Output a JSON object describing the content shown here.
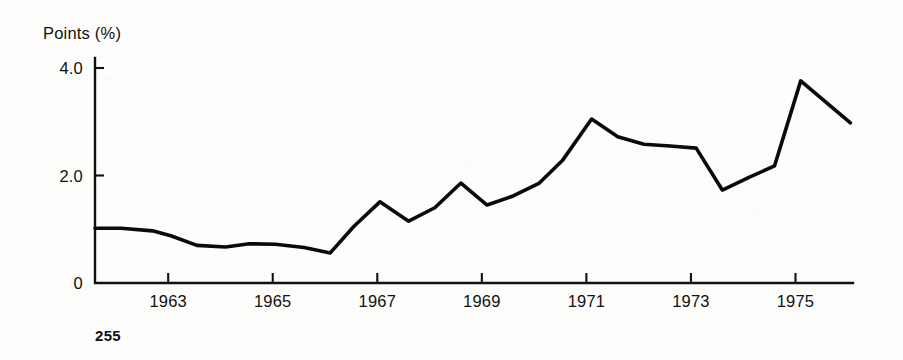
{
  "page": {
    "page_number": "255",
    "background_color": "#fdfdfb",
    "ink_color": "#0a0a0a"
  },
  "chart_data": {
    "type": "line",
    "title": "",
    "subtitle": "",
    "xlabel": "",
    "ylabel": "Points (%)",
    "ylabel_position": "above-axis",
    "grid": false,
    "legend": null,
    "legend_position": "none",
    "xlim": [
      1961.6,
      1976.1
    ],
    "ylim": [
      0,
      4.2
    ],
    "y_ticks": [
      "0",
      "2.0",
      "4.0"
    ],
    "y_tick_values": [
      0,
      2.0,
      4.0
    ],
    "x_ticks": [
      "1963",
      "1965",
      "1967",
      "1969",
      "1971",
      "1973",
      "1975"
    ],
    "x_tick_values": [
      1963,
      1965,
      1967,
      1969,
      1971,
      1973,
      1975
    ],
    "series": [
      {
        "name": "Points (%)",
        "color": "#0a0a0a",
        "x": [
          1961.6,
          1962.1,
          1962.7,
          1963.05,
          1963.55,
          1964.1,
          1964.55,
          1965.05,
          1965.6,
          1966.1,
          1966.55,
          1967.05,
          1967.6,
          1968.1,
          1968.6,
          1969.1,
          1969.6,
          1970.1,
          1970.55,
          1971.1,
          1971.6,
          1972.1,
          1972.6,
          1973.1,
          1973.6,
          1974.1,
          1974.6,
          1975.1,
          1976.05
        ],
        "y": [
          1.02,
          1.02,
          0.97,
          0.88,
          0.7,
          0.67,
          0.73,
          0.72,
          0.66,
          0.56,
          1.05,
          1.51,
          1.15,
          1.4,
          1.86,
          1.45,
          1.62,
          1.86,
          2.29,
          3.05,
          2.72,
          2.58,
          2.55,
          2.51,
          1.73,
          1.96,
          2.18,
          3.76,
          2.98
        ]
      }
    ],
    "annotations": []
  }
}
